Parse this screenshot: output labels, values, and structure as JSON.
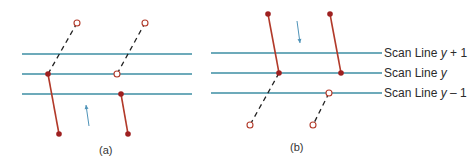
{
  "figure": {
    "colors": {
      "scan_line": "#3d8ea3",
      "edge": "#b23a2a",
      "vertex_fill": "#9e2020",
      "dashed": "#222222",
      "arrow": "#4f93b8"
    },
    "panel_a": {
      "caption": "(a)",
      "scan_lines_y": [
        54,
        74,
        94
      ],
      "scan_lines_x": [
        22,
        192
      ],
      "edges": [
        {
          "solid": [
            [
              48,
              74
            ],
            [
              59,
              134
            ]
          ],
          "dashed": [
            [
              48,
              74
            ],
            [
              77,
              23
            ]
          ],
          "open_vertices": [
            [
              77,
              23
            ]
          ],
          "filled_vertices": [
            [
              48,
              74
            ],
            [
              59,
              134
            ]
          ]
        },
        {
          "solid": [
            [
              121,
              94
            ],
            [
              128,
              134
            ]
          ],
          "dashed": [
            [
              117,
              74
            ],
            [
              145,
              23
            ]
          ],
          "open_vertices": [
            [
              145,
              23
            ],
            [
              117,
              74
            ]
          ],
          "filled_vertices": [
            [
              121,
              94
            ],
            [
              128,
              134
            ]
          ]
        }
      ],
      "arrow": {
        "from": [
          89,
          126
        ],
        "to": [
          86,
          105
        ],
        "direction": "up"
      }
    },
    "panel_b": {
      "caption": "(b)",
      "scan_lines_y": [
        53,
        73,
        93
      ],
      "scan_lines_x": [
        211,
        382
      ],
      "edges": [
        {
          "solid": [
            [
              268,
              14
            ],
            [
              279,
              73
            ]
          ],
          "dashed": [
            [
              279,
              73
            ],
            [
              250,
              125
            ]
          ],
          "open_vertices": [
            [
              250,
              125
            ]
          ],
          "filled_vertices": [
            [
              268,
              14
            ],
            [
              279,
              73
            ]
          ]
        },
        {
          "solid": [
            [
              330,
              14
            ],
            [
              341,
              73
            ]
          ],
          "dashed": [
            [
              329,
              93
            ],
            [
              313,
              125
            ]
          ],
          "open_vertices": [
            [
              329,
              93
            ],
            [
              313,
              125
            ]
          ],
          "filled_vertices": [
            [
              330,
              14
            ],
            [
              341,
              73
            ]
          ]
        }
      ],
      "arrow": {
        "from": [
          297,
          21
        ],
        "to": [
          300,
          43
        ],
        "direction": "down"
      },
      "labels": [
        {
          "prefix": "Scan Line ",
          "var": "y",
          "suffix": " + 1"
        },
        {
          "prefix": "Scan Line ",
          "var": "y",
          "suffix": ""
        },
        {
          "prefix": "Scan Line ",
          "var": "y",
          "suffix": " – 1"
        }
      ]
    }
  }
}
